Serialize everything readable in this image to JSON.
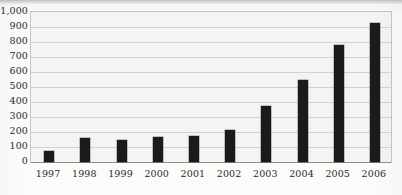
{
  "chart_data": {
    "type": "bar",
    "title": "",
    "subtitle": "",
    "xlabel": "",
    "ylabel": "",
    "categories": [
      "1997",
      "1998",
      "1999",
      "2000",
      "2001",
      "2002",
      "2003",
      "2004",
      "2005",
      "2006"
    ],
    "values": [
      75,
      160,
      150,
      165,
      175,
      215,
      375,
      545,
      780,
      930
    ],
    "series": [
      {
        "name": "",
        "values": [
          75,
          160,
          150,
          165,
          175,
          215,
          375,
          545,
          780,
          930
        ]
      }
    ],
    "ylim": [
      0,
      1000
    ],
    "ytick_step": 100,
    "ytick_labels": [
      "1,000",
      "900",
      "800",
      "700",
      "600",
      "500",
      "400",
      "300",
      "200",
      "100",
      "0"
    ],
    "ytick_values": [
      1000,
      900,
      800,
      700,
      600,
      500,
      400,
      300,
      200,
      100,
      0
    ],
    "grid": true,
    "grid_axis": "y",
    "legend": false,
    "legend_position": "none",
    "bar_color": "#1b1b1b",
    "plot_background_color": "#f4f4f2",
    "gridline_color": "#d2d2d0",
    "axis_color": "#8d8d8b",
    "text_color": "#2a2a2a"
  }
}
